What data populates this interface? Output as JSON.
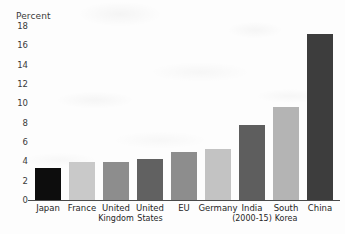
{
  "chart_data": {
    "type": "bar",
    "title": "",
    "subtitle": "",
    "xlabel": "",
    "ylabel": "Percent",
    "ylim": [
      0,
      18
    ],
    "ytick_step": 2,
    "yticks": [
      "18",
      "16",
      "14",
      "12",
      "10",
      "8",
      "6",
      "4",
      "2",
      "0"
    ],
    "grid": false,
    "legend": "none",
    "categories": [
      "Japan",
      "France",
      "United Kingdom",
      "United States",
      "EU",
      "Germany",
      "India (2000-15)",
      "South Korea",
      "China"
    ],
    "category_lines": [
      [
        "Japan",
        ""
      ],
      [
        "France",
        ""
      ],
      [
        "United",
        "Kingdom"
      ],
      [
        "United",
        "States"
      ],
      [
        "EU",
        ""
      ],
      [
        "Germany",
        ""
      ],
      [
        "India",
        "(2000-15)"
      ],
      [
        "South",
        "Korea"
      ],
      [
        "China",
        ""
      ]
    ],
    "values": [
      3.3,
      3.9,
      3.9,
      4.2,
      5.0,
      5.3,
      7.8,
      9.6,
      17.2
    ],
    "bar_colors": [
      "#0d0d0d",
      "#c9c9c9",
      "#8d8d8d",
      "#616161",
      "#8d8d8d",
      "#c3c3c3",
      "#5e5e5e",
      "#b4b4b4",
      "#3d3d3d"
    ]
  },
  "axis": {
    "unit_label": "Percent"
  }
}
